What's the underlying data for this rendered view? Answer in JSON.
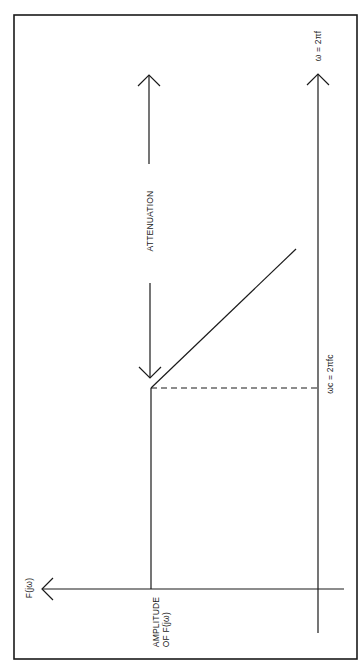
{
  "diagram": {
    "type": "low-pass filter frequency response (rotated 90°)",
    "labels": {
      "omega_axis": "ω = 2πf",
      "cutoff": "ωc = 2πfc",
      "attenuation": "ATTENUATION",
      "f_axis": "F(jω)",
      "amplitude_line1": "AMPLITUDE",
      "amplitude_line2": "OF F(jω)"
    },
    "colors": {
      "line": "#1a1a1a",
      "background": "#ffffff"
    }
  }
}
